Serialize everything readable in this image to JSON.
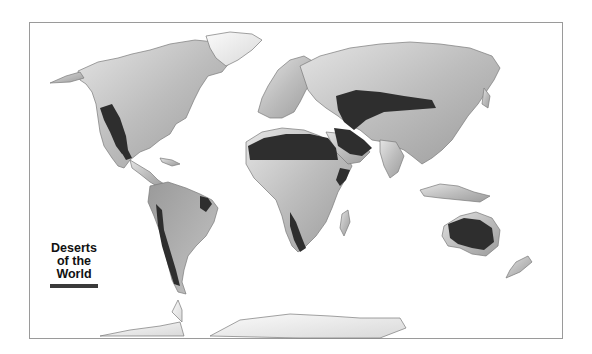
{
  "map": {
    "title": "Deserts of the World",
    "legend": {
      "lines": [
        "Deserts",
        "of the",
        "World"
      ],
      "swatch_color": "#3a3a3a"
    },
    "colors": {
      "land_light": "#d8d8d8",
      "land_mid": "#b5b5b5",
      "land_dark": "#8f8f8f",
      "ice": "#f2f2f2",
      "desert": "#2e2e2e",
      "frame": "#9a9a9a",
      "coast": "#7a7a7a"
    },
    "regions": [
      {
        "name": "North America"
      },
      {
        "name": "Greenland"
      },
      {
        "name": "South America"
      },
      {
        "name": "Europe"
      },
      {
        "name": "Africa"
      },
      {
        "name": "Asia"
      },
      {
        "name": "Australia"
      },
      {
        "name": "Antarctica"
      }
    ],
    "deserts": [
      {
        "name": "North American deserts"
      },
      {
        "name": "Atacama / Patagonian"
      },
      {
        "name": "Caatinga"
      },
      {
        "name": "Sahara"
      },
      {
        "name": "Arabian"
      },
      {
        "name": "Central Asian / Gobi"
      },
      {
        "name": "Horn of Africa"
      },
      {
        "name": "Namib / Kalahari"
      },
      {
        "name": "Australian"
      }
    ]
  }
}
